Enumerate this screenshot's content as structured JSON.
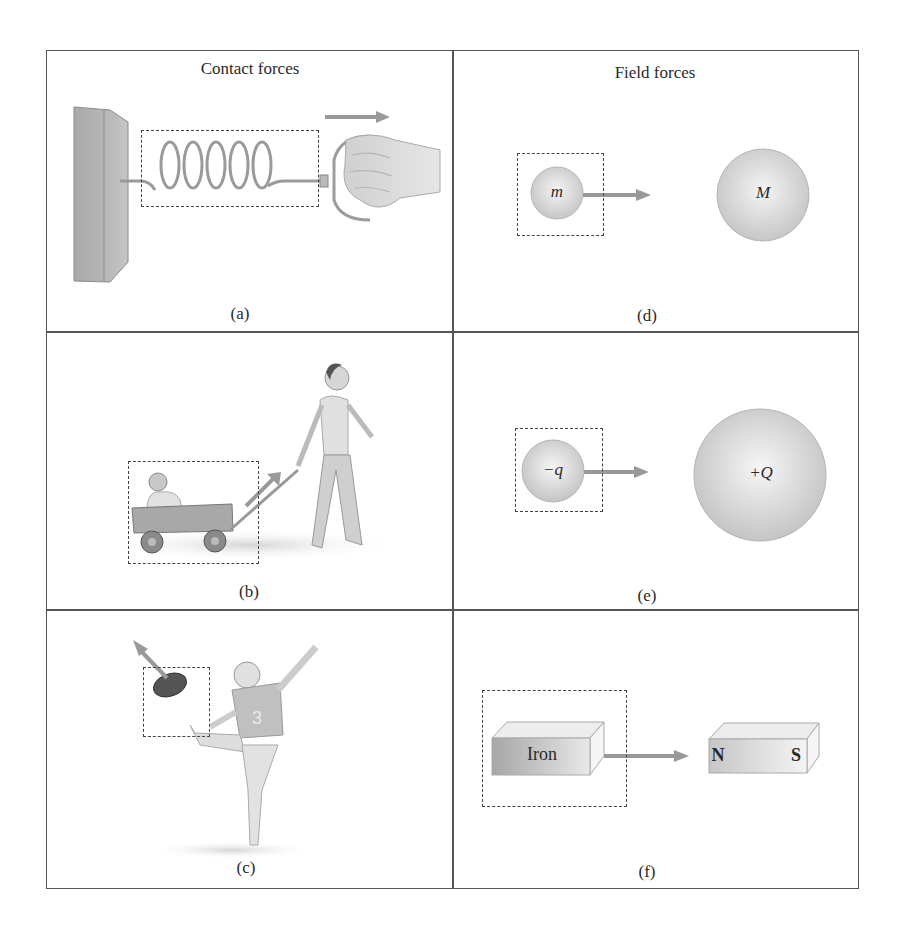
{
  "figure": {
    "columns": [
      {
        "heading": "Contact forces"
      },
      {
        "heading": "Field forces"
      }
    ],
    "panels": [
      {
        "id": "a",
        "label": "(a)",
        "description": "Hand pulling a spring attached to a wall"
      },
      {
        "id": "b",
        "label": "(b)",
        "description": "Child pulling a wagon with a baby inside"
      },
      {
        "id": "c",
        "label": "(c)",
        "description": "Football player kicking a football"
      },
      {
        "id": "d",
        "label": "(d)",
        "description": "Gravitational attraction between masses",
        "small_body": "m",
        "large_body": "M"
      },
      {
        "id": "e",
        "label": "(e)",
        "description": "Electric attraction between charges",
        "small_body": "−q",
        "large_body": "+Q"
      },
      {
        "id": "f",
        "label": "(f)",
        "description": "Magnet attracting iron",
        "iron_label": "Iron",
        "north": "N",
        "south": "S"
      }
    ]
  },
  "colors": {
    "border": "#555555",
    "arrow": "#9a9a9a",
    "sphere_light": "#f2f2f2",
    "sphere_dark": "#b8b8b8",
    "dash": "#444444"
  }
}
